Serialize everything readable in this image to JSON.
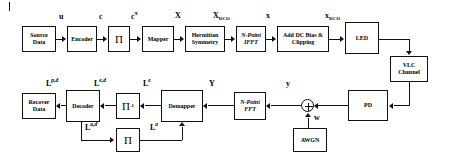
{
  "diagram": {
    "stroke_color": "#111111",
    "background_color": "#ffffff",
    "transmitter": {
      "blocks": [
        {
          "id": "source-data",
          "label": "Source\nData"
        },
        {
          "id": "encoder",
          "label": "Encoder"
        },
        {
          "id": "interleaver",
          "label": "Π"
        },
        {
          "id": "mapper",
          "label": "Mapper"
        },
        {
          "id": "hermitian-symmetry",
          "label": "Hermitian\nSymmetry"
        },
        {
          "id": "n-point-ifft",
          "label": "N-Point\nIFFT"
        },
        {
          "id": "add-dc-bias-clipping",
          "label": "Add DC Bias &\nClipping"
        },
        {
          "id": "led",
          "label": "LED"
        }
      ],
      "signals": {
        "u": "u",
        "c": "c",
        "c_pi": "c",
        "c_pi_sup": "π",
        "X": "X",
        "X_DCO_base": "X",
        "X_DCO_sub": "DCO",
        "x_lower": "x",
        "x_DCO_base": "x",
        "x_DCO_sub": "DCO"
      }
    },
    "channel": {
      "blocks": [
        {
          "id": "vlc-channel",
          "label": "VLC\nChannel"
        },
        {
          "id": "pd",
          "label": "PD"
        },
        {
          "id": "awgn",
          "label": "AWGN"
        }
      ],
      "adder": {
        "id": "summing-junction",
        "symbol": "+"
      },
      "signals": {
        "w": "w"
      }
    },
    "receiver": {
      "blocks": [
        {
          "id": "n-point-fft",
          "label": "N-Point\nFFT"
        },
        {
          "id": "demapper",
          "label": "Demapper"
        },
        {
          "id": "deinterleaver",
          "label": "Π",
          "sup": "-1"
        },
        {
          "id": "decoder",
          "label": "Decoder"
        },
        {
          "id": "recover-data",
          "label": "Recover\nData"
        },
        {
          "id": "interleaver-feedback",
          "label": "Π"
        }
      ],
      "signals": {
        "y_lower": "y",
        "Y": "Y",
        "L_e_base": "L",
        "L_e_sup": "e",
        "L_ed_base": "L",
        "L_ed_sup": "e,d",
        "L_pd_base": "L",
        "L_pd_sup": "p,d",
        "L_ad_base": "L",
        "L_ad_sup": "a,d",
        "L_a_base": "L",
        "L_a_sup": "a"
      }
    }
  }
}
